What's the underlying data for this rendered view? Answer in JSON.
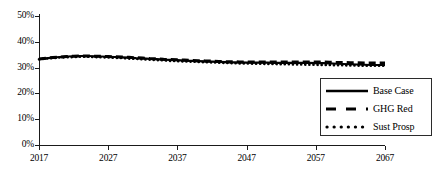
{
  "chart_data": {
    "type": "line",
    "title": "",
    "xlabel": "",
    "ylabel": "",
    "xlim": [
      2017,
      2067
    ],
    "ylim": [
      0,
      50
    ],
    "y_unit": "%",
    "grid": false,
    "legend_position": "lower-right",
    "x_tick_labels": [
      "2017",
      "2027",
      "2037",
      "2047",
      "2057",
      "2067"
    ],
    "x_ticks": [
      2017,
      2027,
      2037,
      2047,
      2057,
      2067
    ],
    "y_tick_labels": [
      "50%",
      "40%",
      "30%",
      "20%",
      "10%",
      "0%"
    ],
    "y_ticks": [
      50,
      40,
      30,
      20,
      10,
      0
    ],
    "x": [
      2017,
      2018,
      2019,
      2020,
      2021,
      2022,
      2023,
      2024,
      2025,
      2026,
      2027,
      2028,
      2029,
      2030,
      2031,
      2032,
      2033,
      2034,
      2035,
      2036,
      2037,
      2038,
      2039,
      2040,
      2041,
      2042,
      2043,
      2044,
      2045,
      2046,
      2047,
      2048,
      2049,
      2050,
      2051,
      2052,
      2053,
      2054,
      2055,
      2056,
      2057,
      2058,
      2059,
      2060,
      2061,
      2062,
      2063,
      2064,
      2065,
      2066,
      2067
    ],
    "series": [
      {
        "name": "Base Case",
        "style": "solid",
        "color": "#000000",
        "values": [
          33.3,
          33.6,
          33.9,
          34.1,
          34.3,
          34.4,
          34.5,
          34.5,
          34.4,
          34.3,
          34.2,
          34.1,
          34.0,
          33.9,
          33.7,
          33.6,
          33.4,
          33.3,
          33.1,
          33.0,
          32.9,
          32.7,
          32.6,
          32.5,
          32.4,
          32.3,
          32.2,
          32.1,
          32.0,
          32.0,
          31.9,
          31.9,
          31.9,
          31.9,
          31.8,
          31.8,
          31.8,
          31.8,
          31.8,
          31.8,
          31.7,
          31.7,
          31.6,
          31.5,
          31.4,
          31.3,
          31.2,
          31.1,
          31.0,
          31.0,
          31.0
        ]
      },
      {
        "name": "GHG Red",
        "style": "dashed",
        "color": "#000000",
        "values": [
          33.3,
          33.6,
          33.9,
          34.1,
          34.3,
          34.4,
          34.5,
          34.5,
          34.4,
          34.4,
          34.3,
          34.2,
          34.1,
          34.0,
          33.8,
          33.7,
          33.5,
          33.4,
          33.2,
          33.1,
          33.0,
          32.9,
          32.8,
          32.7,
          32.6,
          32.5,
          32.4,
          32.3,
          32.3,
          32.2,
          32.2,
          32.2,
          32.2,
          32.2,
          32.2,
          32.2,
          32.2,
          32.2,
          32.2,
          32.2,
          32.2,
          32.2,
          32.1,
          32.0,
          32.0,
          31.9,
          31.9,
          31.8,
          31.8,
          31.8,
          31.8
        ]
      },
      {
        "name": "Sust Prosp",
        "style": "dotted",
        "color": "#000000",
        "values": [
          33.2,
          33.5,
          33.7,
          33.9,
          34.0,
          34.1,
          34.2,
          34.2,
          34.1,
          34.0,
          33.9,
          33.8,
          33.7,
          33.5,
          33.4,
          33.2,
          33.1,
          32.9,
          32.8,
          32.6,
          32.5,
          32.4,
          32.3,
          32.2,
          32.1,
          32.0,
          31.9,
          31.8,
          31.7,
          31.6,
          31.6,
          31.5,
          31.5,
          31.4,
          31.4,
          31.3,
          31.3,
          31.2,
          31.2,
          31.1,
          31.1,
          31.0,
          31.0,
          30.9,
          30.9,
          30.8,
          30.8,
          30.7,
          30.7,
          30.7,
          30.7
        ]
      }
    ]
  },
  "legend": {
    "entries": [
      {
        "label": "Base Case",
        "style": "solid"
      },
      {
        "label": "GHG Red",
        "style": "dashed"
      },
      {
        "label": "Sust Prosp",
        "style": "dotted"
      }
    ]
  },
  "axis": {
    "y_labels": [
      "50%",
      "40%",
      "30%",
      "20%",
      "10%",
      "0%"
    ],
    "x_labels": [
      "2017",
      "2027",
      "2037",
      "2047",
      "2057",
      "2067"
    ]
  },
  "colors": {
    "line": "#000000",
    "axis": "#1a1a1a",
    "background": "#ffffff",
    "legend_border": "#2b2b2b"
  }
}
